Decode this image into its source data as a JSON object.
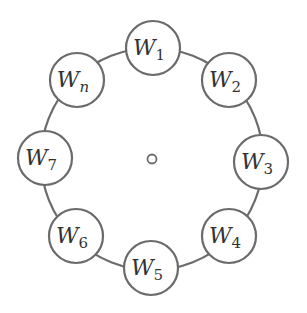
{
  "diagram": {
    "center": {
      "x": 152,
      "y": 159
    },
    "ring_radius": 111,
    "node_radius": 27,
    "stroke_color": "#6b6b6b",
    "center_marker": "small-circle",
    "nodes": [
      {
        "base": "W",
        "sub": "1",
        "x": 153,
        "y": 48
      },
      {
        "base": "W",
        "sub": "2",
        "x": 229,
        "y": 80
      },
      {
        "base": "W",
        "sub": "3",
        "x": 261,
        "y": 162
      },
      {
        "base": "W",
        "sub": "4",
        "x": 229,
        "y": 236
      },
      {
        "base": "W",
        "sub": "5",
        "x": 151,
        "y": 268
      },
      {
        "base": "W",
        "sub": "6",
        "x": 76,
        "y": 236
      },
      {
        "base": "W",
        "sub": "7",
        "x": 45,
        "y": 158
      },
      {
        "base": "W",
        "sub": "n",
        "x": 77,
        "y": 80
      }
    ]
  }
}
